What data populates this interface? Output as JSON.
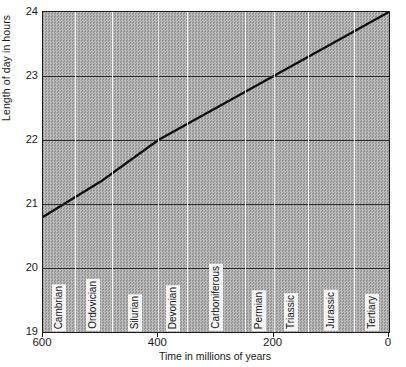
{
  "chart_data": {
    "type": "line",
    "title": "",
    "xlabel": "Time in millions of years",
    "ylabel": "Length of day in hours",
    "xlim": [
      600,
      0
    ],
    "ylim": [
      19,
      24
    ],
    "x_ticks": [
      600,
      400,
      200,
      0
    ],
    "y_ticks": [
      19,
      20,
      21,
      22,
      23,
      24
    ],
    "x_axis_reversed": true,
    "grid": true,
    "legend": "none",
    "series": [
      {
        "name": "Length of day",
        "x": [
          600,
          500,
          400,
          300,
          200,
          100,
          0
        ],
        "values": [
          20.8,
          21.35,
          22.0,
          22.5,
          23.0,
          23.5,
          24.0
        ]
      }
    ],
    "annotations": [
      {
        "label": "Cambrian",
        "start": 600,
        "end": 545
      },
      {
        "label": "Ordovician",
        "start": 545,
        "end": 480
      },
      {
        "label": "Silurian",
        "start": 480,
        "end": 400
      },
      {
        "label": "Devonian",
        "start": 400,
        "end": 350
      },
      {
        "label": "Carboniferous",
        "start": 350,
        "end": 250
      },
      {
        "label": "Permian",
        "start": 250,
        "end": 200
      },
      {
        "label": "Triassic",
        "start": 200,
        "end": 140
      },
      {
        "label": "Jurassic",
        "start": 140,
        "end": 60
      },
      {
        "label": "Tertiary",
        "start": 60,
        "end": 0
      }
    ]
  },
  "axes": {
    "y_title": "Length of day in hours",
    "x_title": "Time in millions of years",
    "y_tick_labels": [
      "24",
      "23",
      "22",
      "21",
      "20",
      "19"
    ],
    "x_tick_labels": [
      "600",
      "400",
      "200",
      "0"
    ]
  },
  "periods": [
    {
      "label": "Cambrian"
    },
    {
      "label": "Ordovician"
    },
    {
      "label": "Silurian"
    },
    {
      "label": "Devonian"
    },
    {
      "label": "Carboniferous"
    },
    {
      "label": "Permian"
    },
    {
      "label": "Triassic"
    },
    {
      "label": "Jurassic"
    },
    {
      "label": "Tertiary"
    }
  ],
  "colors": {
    "plot_background": "#a8a8a8",
    "gridline": "#2a2a2a",
    "period_divider": "#ffffff",
    "data_line": "#101010",
    "label_box": "#f4f4f4",
    "text": "#1a1a1a"
  }
}
